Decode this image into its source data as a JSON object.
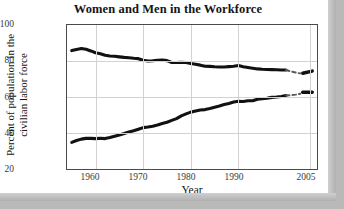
{
  "chart_data": {
    "type": "line",
    "title": "Women and Men in the Workforce",
    "xlabel": "Year",
    "ylabel_line1": "Percent of population in the",
    "ylabel_line2": "civilian labor force",
    "xlim": [
      1954,
      2006.5
    ],
    "ylim": [
      20,
      100
    ],
    "yticks": [
      "100",
      "80",
      "60",
      "40",
      "20"
    ],
    "ytick_values": [
      100,
      80,
      60,
      40,
      20
    ],
    "xticks": [
      "1960",
      "1970",
      "1980",
      "1990",
      "2005"
    ],
    "xtick_values": [
      1960,
      1970,
      1980,
      1990,
      2005
    ],
    "grid": true,
    "legend": "none",
    "series": [
      {
        "name": "Men",
        "style": "solid-then-dashed",
        "color": "#111111",
        "x": [
          1955,
          1956,
          1957,
          1958,
          1959,
          1960,
          1961,
          1962,
          1963,
          1964,
          1965,
          1966,
          1967,
          1968,
          1969,
          1970,
          1971,
          1972,
          1973,
          1974,
          1975,
          1976,
          1977,
          1978,
          1979,
          1980,
          1981,
          1982,
          1983,
          1984,
          1985,
          1986,
          1987,
          1988,
          1989,
          1990,
          1991,
          1992,
          1993,
          1994,
          1995,
          1996,
          1997,
          1998,
          1999,
          2000
        ],
        "values": [
          85.8,
          86.4,
          86.9,
          86.5,
          85.6,
          84.6,
          84.0,
          83.2,
          82.8,
          82.6,
          82.3,
          82.0,
          81.8,
          81.5,
          81.3,
          80.4,
          80.0,
          80.1,
          80.4,
          80.5,
          80.2,
          79.2,
          79.2,
          79.3,
          79.2,
          78.6,
          78.2,
          77.7,
          77.1,
          77.0,
          76.8,
          76.7,
          76.7,
          76.9,
          77.1,
          77.5,
          76.8,
          76.4,
          76.0,
          75.6,
          75.4,
          75.3,
          75.2,
          75.1,
          75.0,
          75.0
        ],
        "dashed_x": [
          2000,
          2001,
          2002,
          2003
        ],
        "dashed_values": [
          75.0,
          74.2,
          73.6,
          73.1
        ],
        "tail_x": [
          2003.5,
          2005.5
        ],
        "tail_values": [
          73.2,
          74.4
        ]
      },
      {
        "name": "Women",
        "style": "solid-then-dashed",
        "color": "#111111",
        "x": [
          1955,
          1956,
          1957,
          1958,
          1959,
          1960,
          1961,
          1962,
          1963,
          1964,
          1965,
          1966,
          1967,
          1968,
          1969,
          1970,
          1971,
          1972,
          1973,
          1974,
          1975,
          1976,
          1977,
          1978,
          1979,
          1980,
          1981,
          1982,
          1983,
          1984,
          1985,
          1986,
          1987,
          1988,
          1989,
          1990,
          1991,
          1992,
          1993,
          1994,
          1995,
          1996,
          1997,
          1998,
          1999,
          2000
        ],
        "values": [
          34.8,
          35.8,
          36.6,
          37.0,
          37.0,
          36.9,
          37.1,
          36.9,
          37.5,
          38.2,
          38.9,
          39.7,
          40.6,
          41.2,
          42.1,
          43.0,
          43.3,
          43.8,
          44.5,
          45.3,
          46.0,
          47.0,
          48.0,
          49.5,
          50.6,
          51.6,
          52.2,
          52.8,
          53.0,
          53.6,
          54.3,
          55.0,
          55.8,
          56.4,
          57.2,
          57.6,
          57.5,
          57.9,
          57.9,
          58.8,
          59.0,
          59.3,
          59.8,
          60.0,
          60.3,
          60.8
        ],
        "dashed_x": [
          2000,
          2001,
          2002,
          2003
        ],
        "dashed_values": [
          60.8,
          61.0,
          61.3,
          61.8
        ],
        "tail_x": [
          2003.5,
          2005.5
        ],
        "tail_values": [
          62.6,
          62.6
        ]
      }
    ]
  }
}
